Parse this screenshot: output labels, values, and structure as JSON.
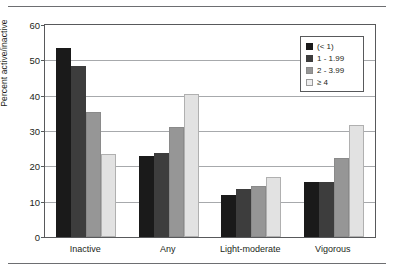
{
  "chart_data": {
    "type": "bar",
    "title": "",
    "subtitle": "",
    "xlabel": "",
    "ylabel": "Percent active/inactive",
    "ylim": [
      0,
      60
    ],
    "yticks": [
      0,
      10,
      20,
      30,
      40,
      50,
      60
    ],
    "ytick_labels": [
      "0",
      "10",
      "20",
      "30",
      "40",
      "50",
      "60"
    ],
    "grid": "horizontal",
    "legend_position": "top-right",
    "legend_title": "",
    "categories": [
      "Inactive",
      "Any",
      "Light-moderate",
      "Vigorous"
    ],
    "series": [
      {
        "name": "(< 1)",
        "color": "#1a1a1a",
        "values": [
          53.5,
          23.0,
          12.0,
          15.7
        ]
      },
      {
        "name": "1 - 1.99",
        "color": "#3d3d3d",
        "values": [
          48.5,
          23.7,
          13.5,
          15.5
        ]
      },
      {
        "name": "2 - 3.99",
        "color": "#969696",
        "values": [
          35.5,
          31.0,
          14.5,
          22.5
        ]
      },
      {
        "name": "≥ 4",
        "color": "#e2e2e2",
        "values": [
          23.5,
          40.5,
          17.0,
          31.7
        ]
      }
    ],
    "annotations": []
  },
  "figure": {
    "rule_color": "#6d6e71",
    "axis_color": "#58595b",
    "gridline_color": "#a7a9ac",
    "background": "#ffffff"
  }
}
